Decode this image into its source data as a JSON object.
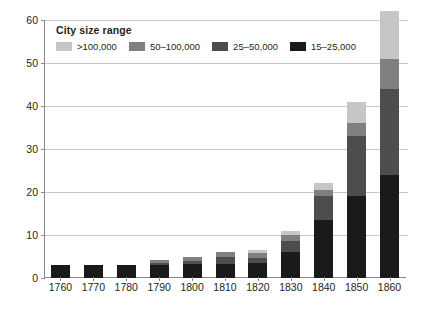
{
  "chart_data": {
    "type": "bar",
    "stacked": true,
    "title": "",
    "xlabel": "",
    "ylabel": "",
    "categories": [
      "1760",
      "1770",
      "1780",
      "1790",
      "1800",
      "1810",
      "1820",
      "1830",
      "1840",
      "1850",
      "1860"
    ],
    "series": [
      {
        "name": "15–25,000",
        "color": "#1a1a1a",
        "values": [
          3,
          3,
          3,
          3,
          3.2,
          3.3,
          3.4,
          6,
          13.5,
          19,
          24
        ]
      },
      {
        "name": "25–50,000",
        "color": "#4d4d4d",
        "values": [
          0,
          0,
          0,
          0.5,
          0.8,
          1.5,
          1.3,
          2.5,
          5.5,
          14,
          20
        ]
      },
      {
        "name": "50–100,000",
        "color": "#808080",
        "values": [
          0,
          0,
          0,
          0.8,
          1.0,
          1.2,
          1.1,
          1.5,
          1.5,
          3,
          7
        ]
      },
      {
        "name": ">100,000",
        "color": "#c6c6c6",
        "values": [
          0,
          0,
          0,
          0,
          0,
          0,
          0.7,
          1,
          1.5,
          5,
          11
        ]
      }
    ],
    "totals": [
      3,
      3,
      3,
      4.3,
      5,
      6,
      6.5,
      11,
      22,
      41,
      62
    ],
    "ylim": [
      0,
      60
    ],
    "yticks": [
      0,
      10,
      20,
      30,
      40,
      50,
      60
    ],
    "grid": true,
    "clipped_bars": [
      "1860"
    ],
    "legend": {
      "title": "City size range",
      "position": "top-left-inside",
      "entries": [
        {
          "label": ">100,000",
          "color": "#c6c6c6"
        },
        {
          "label": "50–100,000",
          "color": "#808080"
        },
        {
          "label": "25–50,000",
          "color": "#4d4d4d"
        },
        {
          "label": "15–25,000",
          "color": "#1a1a1a"
        }
      ]
    },
    "axis_color": "#8a8a8a",
    "grid_color": "#c9c9c9",
    "text_color": "#231f20",
    "background": "#ffffff"
  }
}
